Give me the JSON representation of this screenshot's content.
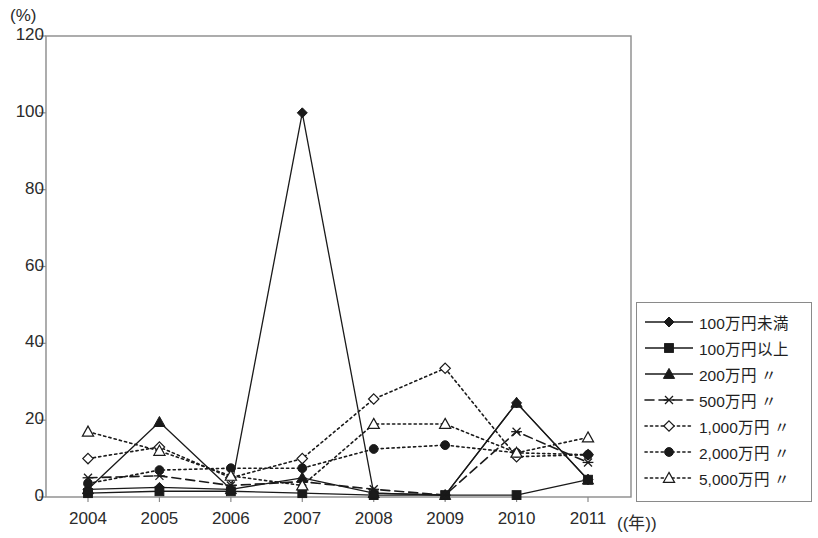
{
  "chart_data": {
    "type": "line",
    "title": "",
    "xlabel": "年",
    "ylabel": "(%)",
    "y_unit_label": "(%)",
    "x_unit_label": "(年)",
    "categories": [
      "2004",
      "2005",
      "2006",
      "2007",
      "2008",
      "2009",
      "2010",
      "2011"
    ],
    "ylim": [
      0,
      120
    ],
    "yticks": [
      0,
      20,
      40,
      60,
      80,
      100,
      120
    ],
    "grid": false,
    "legend_position": "right",
    "series": [
      {
        "name": "100万円未満",
        "marker": "filled-diamond",
        "line": "solid",
        "values": [
          2.0,
          2.5,
          2.0,
          100.0,
          1.0,
          0.5,
          24.5,
          4.5
        ]
      },
      {
        "name": "100万円以上",
        "marker": "filled-square",
        "line": "solid",
        "values": [
          1.0,
          1.5,
          1.5,
          1.0,
          0.5,
          0.5,
          0.5,
          4.5
        ]
      },
      {
        "name": "200万円 〃",
        "marker": "filled-triangle",
        "line": "solid",
        "values": [
          2.0,
          19.5,
          2.0,
          5.0,
          1.0,
          0.5,
          24.5,
          4.5
        ]
      },
      {
        "name": "500万円 〃",
        "marker": "cross-x",
        "line": "dashed",
        "values": [
          5.0,
          5.5,
          3.0,
          4.0,
          2.0,
          0.5,
          17.0,
          9.0
        ]
      },
      {
        "name": "1,000万円 〃",
        "marker": "open-diamond",
        "line": "dotted",
        "values": [
          10.0,
          13.0,
          5.0,
          10.0,
          25.5,
          33.5,
          10.5,
          11.0
        ]
      },
      {
        "name": "2,000万円 〃",
        "marker": "filled-circle",
        "line": "dotted",
        "values": [
          3.5,
          7.0,
          7.5,
          7.5,
          12.5,
          13.5,
          11.5,
          11.0
        ]
      },
      {
        "name": "5,000万円 〃",
        "marker": "open-triangle",
        "line": "dotted",
        "values": [
          17.0,
          12.0,
          5.5,
          3.0,
          19.0,
          19.0,
          11.5,
          15.5
        ]
      }
    ]
  },
  "legend": {
    "items": [
      "100万円未満",
      "100万円以上",
      "200万円 〃",
      "500万円 〃",
      "1,000万円 〃",
      "2,000万円 〃",
      "5,000万円 〃"
    ]
  },
  "colors": {
    "ink": "#1a1a1a",
    "axis": "#8a8a8a",
    "background": "#ffffff"
  }
}
